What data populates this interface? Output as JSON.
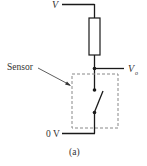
{
  "diagram": {
    "labels": {
      "supply": "V",
      "output": "V",
      "output_sub": "o",
      "ground": "0 V",
      "sensor": "Sensor",
      "caption": "(a)"
    },
    "components": [
      {
        "type": "resistor",
        "position": "top"
      },
      {
        "type": "switch",
        "position": "inside-sensor-box",
        "state": "open"
      }
    ],
    "colors": {
      "wire": "#1a1a1a",
      "dashed_box": "#888888",
      "text": "#333333"
    }
  }
}
